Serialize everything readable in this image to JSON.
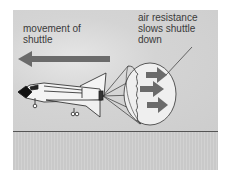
{
  "diagram": {
    "labels": {
      "movement": "movement of shuttle",
      "movement_line1": "movement of",
      "movement_line2": "shuttle",
      "air_line1": "air resistance",
      "air_line2": "slows shuttle",
      "air_line3": "down"
    },
    "elements": {
      "movement_arrow": {
        "direction": "left",
        "color": "#6b6b6b"
      },
      "shuttle": {
        "color": "#f4f4f4",
        "outline": "#222222"
      },
      "parachute": {
        "color": "#ececec",
        "outline": "#333333"
      },
      "air_resistance_arrows": {
        "count": 3,
        "direction": "right",
        "color": "#6b6b6b"
      }
    },
    "colors": {
      "sky": "#d4d4d4",
      "ground": "#cccccc",
      "horizon": "#555555",
      "text": "#3a3a3a"
    }
  }
}
